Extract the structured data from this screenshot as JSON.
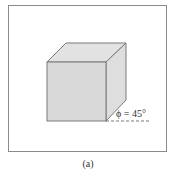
{
  "figure": {
    "caption": "(a)",
    "angle_label": "ϕ = 45°",
    "colors": {
      "frame": "#888888",
      "cube_edge": "#7a7a7a",
      "front_face": "#d8d8d8",
      "top_face": "#e0e0e0",
      "side_face": "#dcdcdc",
      "text": "#333333",
      "dash": "#555555"
    }
  }
}
